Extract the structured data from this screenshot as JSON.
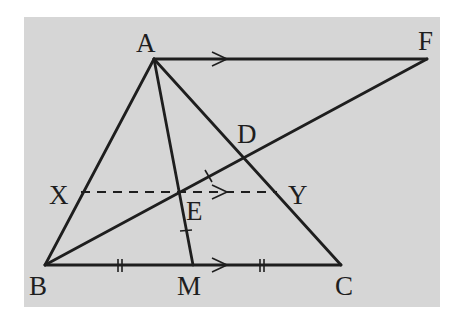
{
  "figure": {
    "background_color": "#d6d6d6",
    "line_color": "#1e1e1e",
    "panel": {
      "x": 24,
      "y": 17,
      "w": 416,
      "h": 290
    }
  },
  "points": {
    "A": {
      "x": 154,
      "y": 59,
      "label": "A",
      "lx": 136,
      "ly": 52
    },
    "F": {
      "x": 427,
      "y": 59,
      "label": "F",
      "lx": 418,
      "ly": 50
    },
    "B": {
      "x": 45,
      "y": 265,
      "label": "B",
      "lx": 29,
      "ly": 295
    },
    "M": {
      "x": 193,
      "y": 265,
      "label": "M",
      "lx": 177,
      "ly": 295
    },
    "C": {
      "x": 341,
      "y": 265,
      "label": "C",
      "lx": 335,
      "ly": 295
    },
    "D": {
      "x": 243,
      "y": 158,
      "label": "D",
      "lx": 237,
      "ly": 143
    },
    "E": {
      "x": 179,
      "y": 192,
      "label": "E",
      "lx": 186,
      "ly": 220
    },
    "X": {
      "x": 81,
      "y": 192,
      "label": "X",
      "lx": 49,
      "ly": 204
    },
    "Y": {
      "x": 277,
      "y": 192,
      "label": "Y",
      "lx": 288,
      "ly": 204
    }
  },
  "segments": [
    "AF",
    "AB",
    "AC",
    "AM",
    "BC",
    "BF"
  ],
  "dashed_segments": [
    "XY"
  ],
  "parallel_arrows": [
    "AF",
    "XY",
    "BC"
  ],
  "equal_marks": {
    "BM": "double-tick",
    "MC": "double-tick",
    "AE_EM": "single-tick"
  }
}
